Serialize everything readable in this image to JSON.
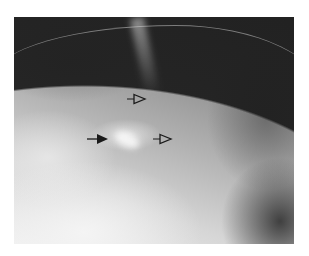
{
  "image": {
    "type": "radiograph",
    "description": "Grayscale mammogram-style X-ray with annotation arrows",
    "annotations": [
      {
        "name": "solid-arrow",
        "style": "filled",
        "x": 89,
        "y": 139,
        "direction": "right"
      },
      {
        "name": "open-arrowhead-upper",
        "style": "outline",
        "x": 127,
        "y": 99,
        "direction": "right"
      },
      {
        "name": "open-arrowhead-lower",
        "style": "outline",
        "x": 153,
        "y": 139,
        "direction": "right"
      }
    ],
    "colors": {
      "background": "#ffffff",
      "dark_region": "#1e1e1e",
      "bright_region": "#f0f0f0",
      "arrow": "#1a1a1a"
    }
  }
}
